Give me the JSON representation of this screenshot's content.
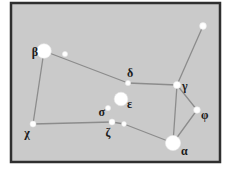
{
  "figure": {
    "type": "constellation-star-map",
    "background": "#ffffff",
    "frame": {
      "x": 11,
      "y": 3,
      "width": 209,
      "height": 159,
      "fill": "#cacaca",
      "stroke": "#2f2f2f",
      "stroke_width": 2.5
    },
    "line_color": "#8c8c8c",
    "line_width": 1.3,
    "star_color": "#ffffff",
    "label_color": "#1c1c1c",
    "label_font_size": 12
  },
  "stars": [
    {
      "id": "beta",
      "label": "β",
      "cx": 44,
      "cy": 51,
      "r": 7.3,
      "label_x": 38,
      "label_y": 56,
      "anchor": "end"
    },
    {
      "id": "beta-companion",
      "label": "",
      "cx": 65,
      "cy": 54,
      "r": 2.6,
      "label_x": 0,
      "label_y": 0,
      "anchor": "start"
    },
    {
      "id": "tail-star",
      "label": "",
      "cx": 203,
      "cy": 26,
      "r": 3.4,
      "label_x": 0,
      "label_y": 0,
      "anchor": "start"
    },
    {
      "id": "delta",
      "label": "δ",
      "cx": 128,
      "cy": 83,
      "r": 2.6,
      "label_x": 130,
      "label_y": 77,
      "anchor": "middle"
    },
    {
      "id": "gamma",
      "label": "γ",
      "cx": 177,
      "cy": 85,
      "r": 3.6,
      "label_x": 182,
      "label_y": 90,
      "anchor": "start"
    },
    {
      "id": "epsilon",
      "label": "ε",
      "cx": 121,
      "cy": 99,
      "r": 6.8,
      "label_x": 127,
      "label_y": 108,
      "anchor": "start"
    },
    {
      "id": "sigma",
      "label": "σ",
      "cx": 108,
      "cy": 108,
      "r": 2.6,
      "label_x": 105,
      "label_y": 116,
      "anchor": "end"
    },
    {
      "id": "zeta-a",
      "label": "ζ",
      "cx": 112,
      "cy": 122,
      "r": 3.0,
      "label_x": 108,
      "label_y": 137,
      "anchor": "middle"
    },
    {
      "id": "zeta-b",
      "label": "",
      "cx": 124,
      "cy": 124,
      "r": 2.4,
      "label_x": 0,
      "label_y": 0,
      "anchor": "start"
    },
    {
      "id": "chi",
      "label": "χ",
      "cx": 33,
      "cy": 124,
      "r": 3.0,
      "label_x": 27,
      "label_y": 137,
      "anchor": "middle"
    },
    {
      "id": "phi",
      "label": "φ",
      "cx": 197,
      "cy": 110,
      "r": 3.3,
      "label_x": 201,
      "label_y": 119,
      "anchor": "start"
    },
    {
      "id": "alpha",
      "label": "α",
      "cx": 173,
      "cy": 143,
      "r": 7.6,
      "label_x": 181,
      "label_y": 155,
      "anchor": "start"
    }
  ],
  "edges": [
    [
      "beta",
      "chi"
    ],
    [
      "beta",
      "delta"
    ],
    [
      "delta",
      "gamma"
    ],
    [
      "gamma",
      "tail-star"
    ],
    [
      "gamma",
      "phi"
    ],
    [
      "gamma",
      "alpha"
    ],
    [
      "phi",
      "alpha"
    ],
    [
      "alpha",
      "zeta-b"
    ],
    [
      "zeta-b",
      "zeta-a"
    ],
    [
      "zeta-a",
      "chi"
    ]
  ]
}
